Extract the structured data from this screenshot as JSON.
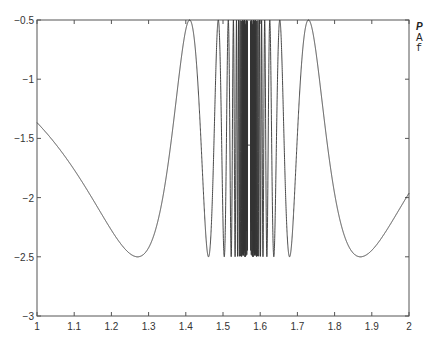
{
  "chart_data": {
    "type": "line",
    "title": "",
    "xlabel": "",
    "ylabel": "",
    "xlim": [
      1,
      2
    ],
    "ylim": [
      -3,
      -0.5
    ],
    "xticks": [
      1,
      1.1,
      1.2,
      1.3,
      1.4,
      1.5,
      1.6,
      1.7,
      1.8,
      1.9,
      2
    ],
    "xtick_labels": [
      "1",
      "1.1",
      "1.2",
      "1.3",
      "1.4",
      "1.5",
      "1.6",
      "1.7",
      "1.8",
      "1.9",
      "2"
    ],
    "yticks": [
      -3,
      -2.5,
      -2,
      -1.5,
      -1,
      -0.5
    ],
    "ytick_labels": [
      "-3",
      "-2.5",
      "-2",
      "-1.5",
      "-1",
      "-0.5"
    ],
    "grid": false,
    "legend": null,
    "series": [
      {
        "name": "f(x)",
        "color": "#333333",
        "description": "Oscillating function, symmetric about x≈1.57, bounded between -2.5 and -0.5, oscillating rapidly near the center",
        "x": [
          1.0,
          1.1,
          1.2,
          1.27,
          1.35,
          1.41,
          1.46,
          1.5,
          1.52,
          1.55,
          1.57,
          1.6,
          1.63,
          1.68,
          1.73,
          1.8,
          1.87,
          1.95,
          2.0
        ],
        "values": [
          -1.1,
          -1.55,
          -2.1,
          -2.42,
          -1.6,
          -0.5,
          -2.52,
          -0.5,
          -2.5,
          -0.6,
          -1.5,
          -2.5,
          -0.5,
          -2.52,
          -0.5,
          -1.9,
          -2.42,
          -2.2,
          -1.88
        ]
      }
    ]
  },
  "side_text": {
    "line1": "P",
    "line2": "A",
    "line3": "f"
  }
}
